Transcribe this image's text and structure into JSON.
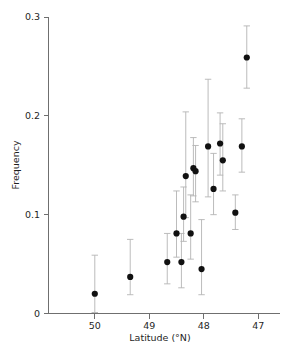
{
  "chart_data": {
    "type": "scatter",
    "title": "",
    "xlabel": "Latitude (°N)",
    "ylabel": "Frequency",
    "xlim": [
      50.85,
      46.6
    ],
    "ylim": [
      0,
      0.3
    ],
    "x_reversed": true,
    "grid": false,
    "legend": null,
    "xticks": [
      50,
      49,
      48,
      47
    ],
    "xticklabels": [
      "50",
      "49",
      "48",
      "47"
    ],
    "yticks": [
      0,
      0.1,
      0.2,
      0.3
    ],
    "yticklabels": [
      "0",
      "0.1",
      "0.2",
      "0.3"
    ],
    "marker": "filled-circle",
    "marker_color": "#111111",
    "errorbar_color": "#b4b4b4",
    "points": [
      {
        "x": 50.0,
        "y": 0.02,
        "ylow": 0.001,
        "yhigh": 0.059
      },
      {
        "x": 49.35,
        "y": 0.037,
        "ylow": 0.019,
        "yhigh": 0.075
      },
      {
        "x": 48.67,
        "y": 0.052,
        "ylow": 0.03,
        "yhigh": 0.081
      },
      {
        "x": 48.5,
        "y": 0.081,
        "ylow": 0.057,
        "yhigh": 0.124
      },
      {
        "x": 48.41,
        "y": 0.052,
        "ylow": 0.026,
        "yhigh": 0.081
      },
      {
        "x": 48.37,
        "y": 0.098,
        "ylow": 0.073,
        "yhigh": 0.128
      },
      {
        "x": 48.33,
        "y": 0.139,
        "ylow": 0.097,
        "yhigh": 0.204
      },
      {
        "x": 48.24,
        "y": 0.081,
        "ylow": 0.055,
        "yhigh": 0.12
      },
      {
        "x": 48.19,
        "y": 0.147,
        "ylow": 0.119,
        "yhigh": 0.178
      },
      {
        "x": 48.15,
        "y": 0.144,
        "ylow": 0.113,
        "yhigh": 0.17
      },
      {
        "x": 48.04,
        "y": 0.045,
        "ylow": 0.019,
        "yhigh": 0.095
      },
      {
        "x": 47.92,
        "y": 0.169,
        "ylow": 0.118,
        "yhigh": 0.237
      },
      {
        "x": 47.82,
        "y": 0.126,
        "ylow": 0.1,
        "yhigh": 0.162
      },
      {
        "x": 47.7,
        "y": 0.172,
        "ylow": 0.14,
        "yhigh": 0.203
      },
      {
        "x": 47.65,
        "y": 0.155,
        "ylow": 0.124,
        "yhigh": 0.192
      },
      {
        "x": 47.42,
        "y": 0.102,
        "ylow": 0.085,
        "yhigh": 0.12
      },
      {
        "x": 47.3,
        "y": 0.169,
        "ylow": 0.143,
        "yhigh": 0.197
      },
      {
        "x": 47.21,
        "y": 0.259,
        "ylow": 0.228,
        "yhigh": 0.291
      }
    ]
  }
}
